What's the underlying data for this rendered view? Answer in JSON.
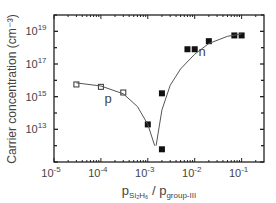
{
  "chart_data": {
    "type": "scatter",
    "title": "",
    "xlabel": "p_SiH4 / p_group-III",
    "xlabel_main": "p",
    "xlabel_sub1": "Si₂H₆",
    "xlabel_sep": " / p",
    "xlabel_sub2": "group-III",
    "ylabel": "Carrier concentration (cm⁻³)",
    "xscale": "log",
    "yscale": "log",
    "xlim": [
      1e-05,
      0.3
    ],
    "ylim": [
      100000000000.0,
      1e+20
    ],
    "x_ticks": [
      {
        "base": "10",
        "exp": "-5",
        "value": 1e-05
      },
      {
        "base": "10",
        "exp": "-4",
        "value": 0.0001
      },
      {
        "base": "10",
        "exp": "-3",
        "value": 0.001
      },
      {
        "base": "10",
        "exp": "-2",
        "value": 0.01
      },
      {
        "base": "10",
        "exp": "-1",
        "value": 0.1
      }
    ],
    "y_ticks": [
      {
        "base": "10",
        "exp": "13",
        "value": 10000000000000.0
      },
      {
        "base": "10",
        "exp": "15",
        "value": 1000000000000000.0
      },
      {
        "base": "10",
        "exp": "17",
        "value": 1e+17
      },
      {
        "base": "10",
        "exp": "19",
        "value": 1e+19
      }
    ],
    "grid": false,
    "annotations": [
      {
        "text": "p",
        "x": 0.00012,
        "y": 400000000000000.0
      },
      {
        "text": "n",
        "x": 0.012,
        "y": 3e+17
      }
    ],
    "series": [
      {
        "name": "p-type",
        "marker": "open-square",
        "points": [
          [
            3e-05,
            5600000000000000.0
          ],
          [
            0.0001,
            4000000000000000.0
          ],
          [
            0.0003,
            1800000000000000.0
          ]
        ]
      },
      {
        "name": "n-type",
        "marker": "filled-square",
        "points": [
          [
            0.001,
            20000000000000.0
          ],
          [
            0.002,
            1600000000000000.0
          ],
          [
            0.002,
            600000000000.0
          ],
          [
            0.007,
            8e+17
          ],
          [
            0.01,
            8e+17
          ],
          [
            0.02,
            2.5e+18
          ],
          [
            0.07,
            5.6e+18
          ],
          [
            0.1,
            5.6e+18
          ]
        ]
      },
      {
        "name": "p-fit",
        "marker": "line",
        "points": [
          [
            3e-05,
            7000000000000000.0
          ],
          [
            0.0001,
            4500000000000000.0
          ],
          [
            0.0003,
            1500000000000000.0
          ],
          [
            0.0006,
            250000000000000.0
          ],
          [
            0.001,
            20000000000000.0
          ],
          [
            0.0014,
            1000000000000.0
          ]
        ]
      },
      {
        "name": "n-fit",
        "marker": "line",
        "points": [
          [
            0.0015,
            1000000000000.0
          ],
          [
            0.002,
            150000000000000.0
          ],
          [
            0.003,
            5000000000000000.0
          ],
          [
            0.005,
            5e+16
          ],
          [
            0.01,
            4e+17
          ],
          [
            0.02,
            1.8e+18
          ],
          [
            0.05,
            5e+18
          ],
          [
            0.1,
            7e+18
          ]
        ]
      }
    ]
  }
}
